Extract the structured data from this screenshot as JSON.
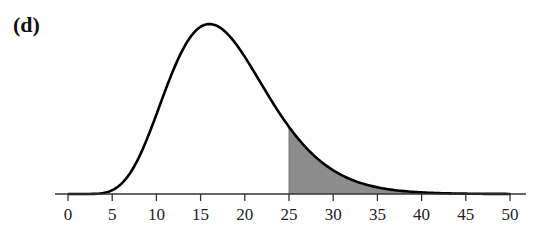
{
  "panel_label": "(d)",
  "chart_data": {
    "type": "area",
    "title": "",
    "panel": "(d)",
    "distribution": "chi-square-like density curve (right-skewed)",
    "degrees_of_freedom_estimate": 18,
    "mode_estimate": 16,
    "xlabel": "",
    "ylabel": "",
    "xlim": [
      0,
      50
    ],
    "x_ticks": [
      0,
      5,
      10,
      15,
      20,
      25,
      30,
      35,
      40,
      45,
      50
    ],
    "x_tick_labels": [
      "0",
      "5",
      "10",
      "15",
      "20",
      "25",
      "30",
      "35",
      "40",
      "45",
      "50"
    ],
    "y_axis_visible": false,
    "grid": false,
    "legend": null,
    "shaded_region": {
      "from": 25,
      "to": 50,
      "color": "#8c8c8c",
      "meaning": "upper-tail area P(X > 25)"
    },
    "curve_color": "#000000"
  },
  "colors": {
    "curve": "#000000",
    "shade": "#8c8c8c",
    "axis": "#333333",
    "background": "#ffffff"
  }
}
